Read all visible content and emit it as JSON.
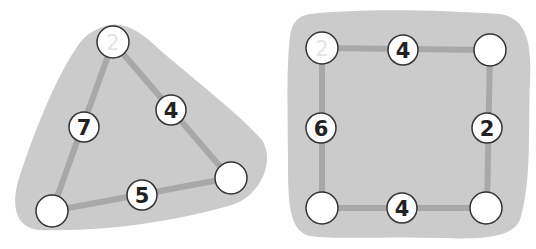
{
  "colors": {
    "background": "#ffffff",
    "region": "#cbcbcb",
    "edge": "#a8a8a8",
    "node_fill": "#ffffff",
    "node_stroke": "#333333",
    "label": "#222222",
    "faint_label": "#e4e4e4"
  },
  "figures": [
    {
      "name": "triangle",
      "nodes": [
        {
          "label": "2",
          "faint": true
        },
        {
          "label": ""
        },
        {
          "label": ""
        }
      ],
      "edge_labels": {
        "left": "7",
        "right": "4",
        "bottom": "5"
      }
    },
    {
      "name": "square",
      "nodes": [
        {
          "label": "2",
          "faint": true
        },
        {
          "label": ""
        },
        {
          "label": ""
        },
        {
          "label": ""
        }
      ],
      "edge_labels": {
        "top": "4",
        "left": "6",
        "right": "2",
        "bottom": "4"
      }
    }
  ]
}
